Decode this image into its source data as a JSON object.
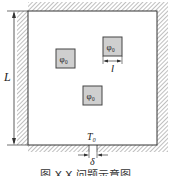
{
  "diagram": {
    "type": "heat-conduction-domain-schematic",
    "domain_label": "L",
    "source_label": "φ₀",
    "sources": [
      {
        "id": "source-left",
        "label": "φ₀"
      },
      {
        "id": "source-top-right",
        "label": "φ₀"
      },
      {
        "id": "source-center",
        "label": "φ₀"
      }
    ],
    "source_size_label": "l",
    "boundary_temperature_label": "T₀",
    "outlet_width_label": "δ",
    "caption": "图 X-X  问题示意图",
    "colors": {
      "line": "#333333",
      "hatch": "#888888",
      "source_fill": "#cfcfcf",
      "background": "#ffffff"
    }
  }
}
